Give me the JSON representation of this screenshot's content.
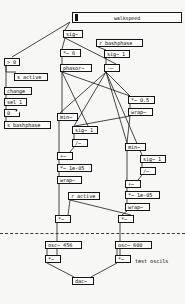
{
  "window": {
    "title": "walkspeed",
    "canvas_bg": "#f7f7f5",
    "box_bg": "#fdfdfb",
    "stroke": "#151515"
  },
  "slider": {
    "name": "walkspeed",
    "label": "walkspeed",
    "value_position_pct": 2
  },
  "objects": [
    {
      "id": "gt0",
      "text": "> 0",
      "kind": "obj",
      "x": 4,
      "y": 58,
      "w": 16,
      "h": 8
    },
    {
      "id": "s_active",
      "text": "s active",
      "kind": "obj",
      "x": 14,
      "y": 73,
      "w": 34,
      "h": 8
    },
    {
      "id": "change",
      "text": "change",
      "kind": "obj",
      "x": 4,
      "y": 87,
      "w": 28,
      "h": 8
    },
    {
      "id": "sel1",
      "text": "sel 1",
      "kind": "obj",
      "x": 4,
      "y": 98,
      "w": 23,
      "h": 8
    },
    {
      "id": "numzero",
      "text": "0",
      "kind": "num",
      "x": 4,
      "y": 109,
      "w": 16,
      "h": 8
    },
    {
      "id": "s_bashph",
      "text": "s bashphase",
      "kind": "obj",
      "x": 4,
      "y": 121,
      "w": 47,
      "h": 8
    },
    {
      "id": "sig_top",
      "text": "sig~",
      "kind": "obj",
      "x": 63,
      "y": 30,
      "w": 20,
      "h": 8
    },
    {
      "id": "r_bashph",
      "text": "r bashphase",
      "kind": "obj",
      "x": 96,
      "y": 39,
      "w": 47,
      "h": 8
    },
    {
      "id": "times6",
      "text": "*~ 6",
      "kind": "obj",
      "x": 60,
      "y": 49,
      "w": 21,
      "h": 8
    },
    {
      "id": "sig1_top",
      "text": "sig~ 1",
      "kind": "obj",
      "x": 104,
      "y": 50,
      "w": 26,
      "h": 8
    },
    {
      "id": "phasor",
      "text": "phasor~",
      "kind": "obj",
      "x": 60,
      "y": 64,
      "w": 32,
      "h": 8
    },
    {
      "id": "minus_top",
      "text": "-~",
      "kind": "obj",
      "x": 104,
      "y": 64,
      "w": 16,
      "h": 8
    },
    {
      "id": "times05",
      "text": "*~ 0.5",
      "kind": "obj",
      "x": 128,
      "y": 96,
      "w": 27,
      "h": 8
    },
    {
      "id": "wrap_r1",
      "text": "wrap~",
      "kind": "obj",
      "x": 128,
      "y": 108,
      "w": 25,
      "h": 8
    },
    {
      "id": "min_l",
      "text": "min~",
      "kind": "obj",
      "x": 57,
      "y": 113,
      "w": 21,
      "h": 8
    },
    {
      "id": "sig1_l",
      "text": "sig~ 1",
      "kind": "obj",
      "x": 72,
      "y": 126,
      "w": 26,
      "h": 8
    },
    {
      "id": "div_l",
      "text": "/~",
      "kind": "obj",
      "x": 72,
      "y": 139,
      "w": 16,
      "h": 8
    },
    {
      "id": "plus_l",
      "text": "+~",
      "kind": "obj",
      "x": 57,
      "y": 152,
      "w": 16,
      "h": 8
    },
    {
      "id": "times1e5_l",
      "text": "*~ 1e-05",
      "kind": "obj",
      "x": 57,
      "y": 164,
      "w": 35,
      "h": 8
    },
    {
      "id": "wrap_l",
      "text": "wrap~",
      "kind": "obj",
      "x": 57,
      "y": 176,
      "w": 25,
      "h": 8
    },
    {
      "id": "min_r",
      "text": "min~",
      "kind": "obj",
      "x": 125,
      "y": 143,
      "w": 21,
      "h": 8
    },
    {
      "id": "sig1_r",
      "text": "sig~ 1",
      "kind": "obj",
      "x": 140,
      "y": 155,
      "w": 26,
      "h": 8
    },
    {
      "id": "div_r",
      "text": "/~",
      "kind": "obj",
      "x": 140,
      "y": 167,
      "w": 16,
      "h": 8
    },
    {
      "id": "plus_r",
      "text": "+~",
      "kind": "obj",
      "x": 125,
      "y": 180,
      "w": 16,
      "h": 8
    },
    {
      "id": "times1e5_r",
      "text": "*~ 1e-05",
      "kind": "obj",
      "x": 125,
      "y": 191,
      "w": 35,
      "h": 8
    },
    {
      "id": "wrap_r2",
      "text": "wrap~",
      "kind": "obj",
      "x": 125,
      "y": 203,
      "w": 25,
      "h": 8
    },
    {
      "id": "r_active",
      "text": "r active",
      "kind": "obj",
      "x": 68,
      "y": 192,
      "w": 32,
      "h": 8
    },
    {
      "id": "mul_l",
      "text": "*~",
      "kind": "obj",
      "x": 55,
      "y": 215,
      "w": 16,
      "h": 8
    },
    {
      "id": "mul_r",
      "text": "*~",
      "kind": "obj",
      "x": 118,
      "y": 215,
      "w": 16,
      "h": 8
    },
    {
      "id": "osc456",
      "text": "osc~ 456",
      "kind": "obj",
      "x": 45,
      "y": 241,
      "w": 37,
      "h": 8
    },
    {
      "id": "osc600",
      "text": "osc~ 600",
      "kind": "obj",
      "x": 115,
      "y": 241,
      "w": 37,
      "h": 8
    },
    {
      "id": "mul_b_l",
      "text": "*~",
      "kind": "obj",
      "x": 45,
      "y": 255,
      "w": 16,
      "h": 8
    },
    {
      "id": "mul_b_r",
      "text": "*~",
      "kind": "obj",
      "x": 115,
      "y": 255,
      "w": 16,
      "h": 8
    },
    {
      "id": "dac",
      "text": "dac~",
      "kind": "obj",
      "x": 72,
      "y": 277,
      "w": 22,
      "h": 8
    }
  ],
  "comments": [
    {
      "id": "test_osc",
      "text": "test oscils",
      "x": 135,
      "y": 259
    }
  ],
  "dsp_rule": {
    "y": 233,
    "width": 185
  }
}
